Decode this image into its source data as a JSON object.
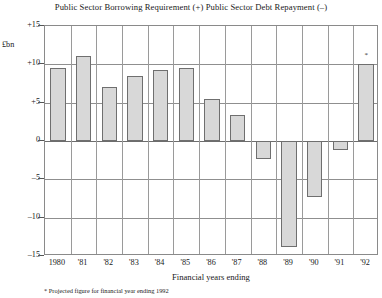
{
  "chart_data": {
    "type": "bar",
    "title": "Public Sector Borrowing Requirement (+)  Public Sector Debt Repayment (–)",
    "xlabel": "Financial years ending",
    "ylabel": "£bn",
    "unit_label": "£bn",
    "ylim": [
      -15,
      15
    ],
    "ytick_values": [
      15,
      10,
      5,
      0,
      -5,
      -10,
      -15
    ],
    "ytick_labels": [
      "+15",
      "+10",
      "+5",
      "0",
      "–5",
      "–10",
      "–15"
    ],
    "grid": true,
    "legend": "none",
    "categories": [
      "1980",
      "'81",
      "'82",
      "'83",
      "'84",
      "'85",
      "'86",
      "'87",
      "'88",
      "'89",
      "'90",
      "'91",
      "'92"
    ],
    "values": [
      9.5,
      11.1,
      7.0,
      8.5,
      9.3,
      9.5,
      5.5,
      3.4,
      -2.4,
      -13.8,
      -7.3,
      -1.2,
      10.0
    ],
    "annotations": [
      {
        "category": "'92",
        "marker": "*",
        "note": "Projected figure for financial year ending 1992"
      }
    ],
    "footnote": "* Projected figure for financial year ending 1992",
    "bar_fill_color": "#d8d8d8",
    "bar_edge_color": "#6f6f6f",
    "frame_color": "#8a8a8a",
    "grid_color": "#8f8f8f"
  }
}
